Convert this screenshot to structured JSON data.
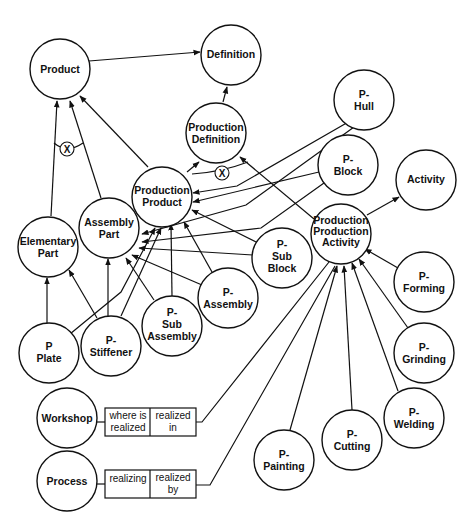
{
  "nodes": {
    "product": {
      "lines": [
        "Product"
      ]
    },
    "definition": {
      "lines": [
        "Definition"
      ]
    },
    "production_definition": {
      "lines": [
        "Production",
        "Definition"
      ]
    },
    "production_product": {
      "lines": [
        "Production",
        "Product"
      ]
    },
    "elementary_part": {
      "lines": [
        "Elementary",
        "Part"
      ]
    },
    "assembly_part": {
      "lines": [
        "Assembly",
        "Part"
      ]
    },
    "p_hull": {
      "lines": [
        "P-",
        "Hull"
      ]
    },
    "p_block": {
      "lines": [
        "P-",
        "Block"
      ]
    },
    "activity": {
      "lines": [
        "Activity"
      ]
    },
    "production_activity": {
      "lines": [
        "Production",
        "Production",
        "Activity"
      ]
    },
    "p_sub_block": {
      "lines": [
        "P-",
        "Sub",
        "Block"
      ]
    },
    "p_assembly": {
      "lines": [
        "P-",
        "Assembly"
      ]
    },
    "p_sub_assembly": {
      "lines": [
        "P-",
        "Sub",
        "Assembly"
      ]
    },
    "p_plate": {
      "lines": [
        "P",
        "Plate"
      ]
    },
    "p_stiffener": {
      "lines": [
        "P-",
        "Stiffener"
      ]
    },
    "p_forming": {
      "lines": [
        "P-",
        "Forming"
      ]
    },
    "p_grinding": {
      "lines": [
        "P-",
        "Grinding"
      ]
    },
    "p_welding": {
      "lines": [
        "P-",
        "Welding"
      ]
    },
    "p_cutting": {
      "lines": [
        "P-",
        "Cutting"
      ]
    },
    "p_painting": {
      "lines": [
        "P-",
        "Painting"
      ]
    },
    "workshop": {
      "lines": [
        "Workshop"
      ]
    },
    "process": {
      "lines": [
        "Process"
      ]
    }
  },
  "relations": {
    "workshop": {
      "left": [
        "where is",
        "realized"
      ],
      "right": [
        "realized",
        "in"
      ]
    },
    "process": {
      "left": [
        "realizing"
      ],
      "right": [
        "realized",
        "by"
      ]
    }
  },
  "exclusive_marker": "X"
}
